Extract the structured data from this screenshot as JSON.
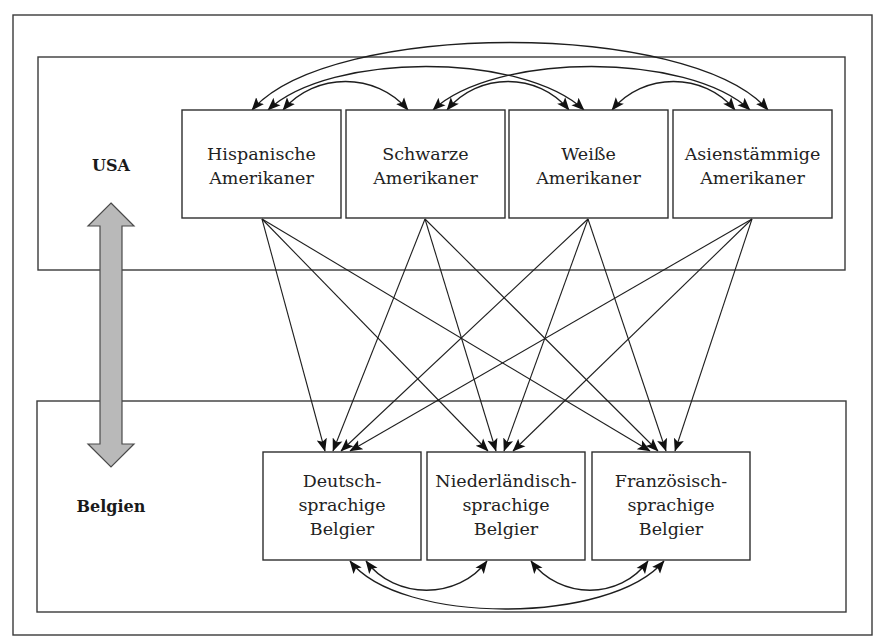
{
  "diagram": {
    "regions": {
      "usa": {
        "label": "USA"
      },
      "belgium": {
        "label": "Belgien"
      }
    },
    "usa_groups": [
      {
        "id": "hispanic",
        "lines": [
          "Hispanische",
          "Amerikaner"
        ]
      },
      {
        "id": "black",
        "lines": [
          "Schwarze",
          "Amerikaner"
        ]
      },
      {
        "id": "white",
        "lines": [
          "Weiße",
          "Amerikaner"
        ]
      },
      {
        "id": "asian",
        "lines": [
          "Asienstämmige",
          "Amerikaner"
        ]
      }
    ],
    "belgian_groups": [
      {
        "id": "german",
        "lines": [
          "Deutsch-",
          "sprachige",
          "Belgier"
        ]
      },
      {
        "id": "dutch",
        "lines": [
          "Niederländisch-",
          "sprachige",
          "Belgier"
        ]
      },
      {
        "id": "french",
        "lines": [
          "Französisch-",
          "sprachige",
          "Belgier"
        ]
      }
    ],
    "relations": {
      "usa_bidirectional_pairs": [
        [
          "hispanic",
          "asian"
        ],
        [
          "hispanic",
          "white"
        ],
        [
          "hispanic",
          "black"
        ],
        [
          "black",
          "asian"
        ],
        [
          "black",
          "white"
        ],
        [
          "white",
          "asian"
        ]
      ],
      "belgium_bidirectional_pairs": [
        [
          "german",
          "french"
        ],
        [
          "german",
          "dutch"
        ],
        [
          "dutch",
          "french"
        ]
      ],
      "usa_to_belgium_directed": "every USA group -> every Belgian group",
      "country_link": "USA <-> Belgien"
    },
    "colors": {
      "line": "#1e1e1e",
      "frame": "#3a3a3a",
      "double_arrow_fill": "#b9b9b9",
      "background": "#ffffff"
    }
  }
}
